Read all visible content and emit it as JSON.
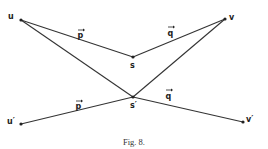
{
  "figure": {
    "caption": "Fig. 8.",
    "points": {
      "u": {
        "label": "u",
        "x": 21,
        "y": 20
      },
      "v": {
        "label": "v",
        "x": 225,
        "y": 19
      },
      "s": {
        "label": "s",
        "x": 133,
        "y": 57
      },
      "s_prime": {
        "label": "s′",
        "x": 133,
        "y": 97
      },
      "u_prime": {
        "label": "u′",
        "x": 21,
        "y": 124
      },
      "v_prime": {
        "label": "v′",
        "x": 243,
        "y": 122
      }
    },
    "vectors": {
      "p_top": "p",
      "q_top": "q",
      "p_bottom": "p",
      "q_bottom": "q"
    }
  }
}
